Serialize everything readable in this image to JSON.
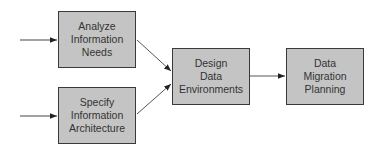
{
  "diagram": {
    "type": "flowchart",
    "colors": {
      "box_fill": "#c4c4c4",
      "box_border": "#3a3a3a",
      "text": "#333333",
      "arrow": "#222222"
    },
    "nodes": [
      {
        "id": "analyze",
        "lines": [
          "Analyze",
          "Information",
          "Needs"
        ]
      },
      {
        "id": "specify",
        "lines": [
          "Specify",
          "Information",
          "Architecture"
        ]
      },
      {
        "id": "design",
        "lines": [
          "Design",
          "Data",
          "Environments"
        ]
      },
      {
        "id": "migration",
        "lines": [
          "Data",
          "Migration",
          "Planning"
        ]
      }
    ],
    "edges": [
      {
        "from": "external-input-1",
        "to": "analyze"
      },
      {
        "from": "external-input-2",
        "to": "specify"
      },
      {
        "from": "analyze",
        "to": "design"
      },
      {
        "from": "specify",
        "to": "design"
      },
      {
        "from": "design",
        "to": "migration"
      }
    ]
  }
}
